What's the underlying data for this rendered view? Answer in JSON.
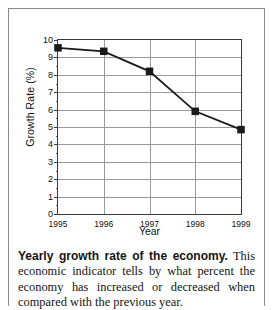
{
  "figure": {
    "caption_lead": "Yearly growth rate of the economy.",
    "caption_body": " This economic indicator tells by what percent the economy has increased or decreased when compared with the previous year."
  },
  "chart_data": {
    "type": "line",
    "title": "",
    "xlabel": "Year",
    "ylabel": "Growth Rate (%)",
    "categories": [
      "1995",
      "1996",
      "1997",
      "1998",
      "1999"
    ],
    "x": [
      1995,
      1996,
      1997,
      1998,
      1999
    ],
    "values": [
      9.55,
      9.35,
      8.2,
      5.9,
      4.85
    ],
    "series": [
      {
        "name": "Growth Rate",
        "values": [
          9.55,
          9.35,
          8.2,
          5.9,
          4.85
        ]
      }
    ],
    "xlim": [
      1995,
      1999
    ],
    "ylim": [
      0,
      10
    ],
    "ytick_labels": [
      "0",
      "1",
      "2",
      "3",
      "4",
      "5",
      "6",
      "7",
      "8",
      "9",
      "10"
    ],
    "ytick_values": [
      0,
      1,
      2,
      3,
      4,
      5,
      6,
      7,
      8,
      9,
      10
    ],
    "xtick_labels": [
      "1995",
      "1996",
      "1997",
      "1998",
      "1999"
    ],
    "grid": true,
    "legend": false,
    "marker": "square",
    "line_color": "#1a1a1a",
    "marker_color": "#1a1a1a",
    "grid_color": "#9a9a9a",
    "axis_color": "#3a3a3a"
  }
}
